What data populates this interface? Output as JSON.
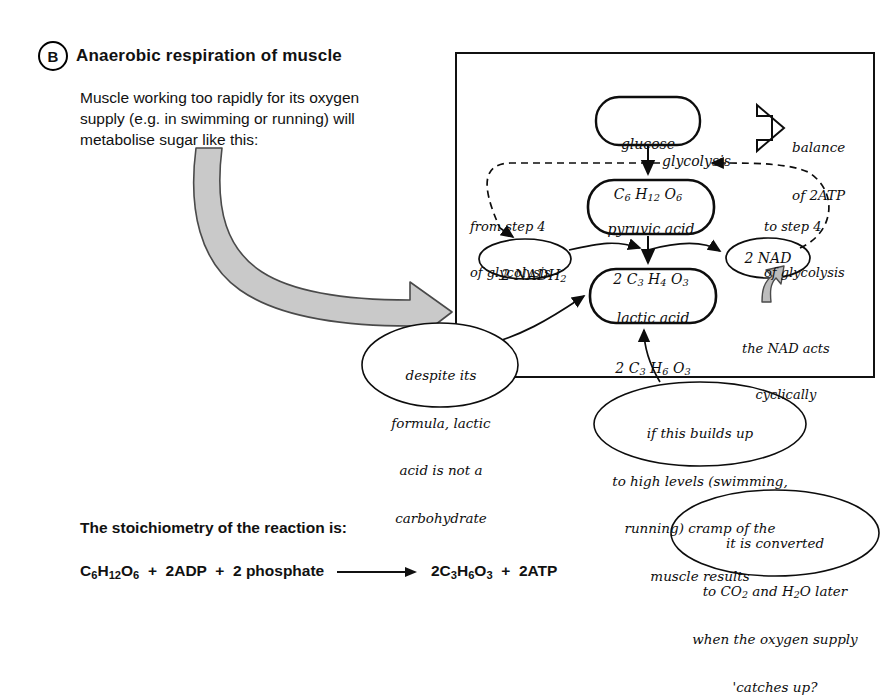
{
  "section": {
    "letter": "B",
    "title": "Anaerobic respiration of muscle"
  },
  "intro": {
    "line1": "Muscle working too rapidly for its oxygen",
    "line2": "supply (e.g. in swimming or running) will",
    "line3": "metabolise sugar like this:"
  },
  "diagram": {
    "nodes": {
      "glucose": {
        "name": "glucose",
        "formula": "C6 H12 O6"
      },
      "pyruvic": {
        "name": "pyruvic acid",
        "formula": "2 C3 H4 O3"
      },
      "lactic": {
        "name": "lactic acid",
        "formula": "2 C3 H6 O3"
      },
      "nadh2": {
        "label": "2 NADH2"
      },
      "nad": {
        "label": "2 NAD"
      }
    },
    "labels": {
      "glycolysis": "glycolysis",
      "balance_arrow_line1": "balance",
      "balance_arrow_line2": "of 2ATP",
      "from_step_line1": "from step 4",
      "from_step_line2": "of glycolysis",
      "to_step_line1": "to step 4",
      "to_step_line2": "of glycolysis",
      "nad_cyclic_line1": "the NAD acts",
      "nad_cyclic_line2": "cyclically"
    },
    "callouts": {
      "lactic_note": {
        "line1": "despite its",
        "line2": "formula, lactic",
        "line3": "acid is not a",
        "line4": "carbohydrate"
      },
      "cramp_note": {
        "line1": "if this builds up",
        "line2": "to high levels (swimming,",
        "line3": "running) cramp of the",
        "line4": "muscle results"
      },
      "converted_note": {
        "line1": "it is converted",
        "line2": "to CO2 and H2O later",
        "line3": "when the oxygen supply",
        "line4": "'catches up?"
      }
    }
  },
  "stoichiometry": {
    "title": "The stoichiometry of the reaction is:",
    "reactants": "C6H12O6  +  2ADP  +  2 phosphate",
    "products": "2C3H6O3  +  2ATP"
  },
  "colors": {
    "ink": "#0d0d0d",
    "text": "#111111",
    "arrow_fill": "#c9c9c9",
    "arrow_stroke": "#4a4a4a",
    "page": "#ffffff"
  }
}
